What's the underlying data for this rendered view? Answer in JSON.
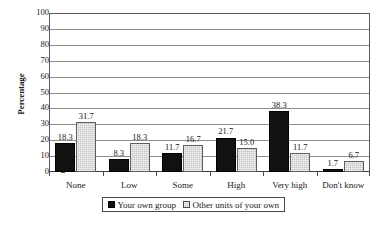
{
  "chart_data": {
    "type": "bar",
    "title": "",
    "subtitle": "",
    "xlabel": "",
    "ylabel": "Percentage",
    "ylim": [
      0,
      100
    ],
    "yticks": [
      0,
      10,
      20,
      30,
      40,
      50,
      60,
      70,
      80,
      90,
      100
    ],
    "grid": "horizontal",
    "legend_position": "bottom-center",
    "categories": [
      "None",
      "Low",
      "Some",
      "High",
      "Very high",
      "Don't know"
    ],
    "series": [
      {
        "name": "Your own group",
        "color": "#111111",
        "pattern": "solid",
        "values": [
          18.3,
          8.3,
          11.7,
          21.7,
          38.3,
          1.7
        ],
        "labels": [
          "18.3",
          "8.3",
          "11.7",
          "21.7",
          "38.3",
          "1.7"
        ]
      },
      {
        "name": "Other units of your own",
        "color": "#c3c3c3",
        "pattern": "checkered",
        "values": [
          31.7,
          18.3,
          16.7,
          15.0,
          11.7,
          6.7
        ],
        "labels": [
          "31.7",
          "18.3",
          "16.7",
          "15.0",
          "11.7",
          "6.7"
        ]
      }
    ]
  },
  "axes": {
    "y_tick_labels": [
      "100",
      "90",
      "80",
      "70",
      "60",
      "50",
      "40",
      "30",
      "20",
      "10",
      "0"
    ],
    "y_title": "Percentage",
    "x_tick_labels": [
      "None",
      "Low",
      "Some",
      "High",
      "Very high",
      "Don't know"
    ]
  },
  "legend": {
    "items": [
      {
        "label": "Your own group"
      },
      {
        "label": "Other units of your own"
      }
    ]
  }
}
